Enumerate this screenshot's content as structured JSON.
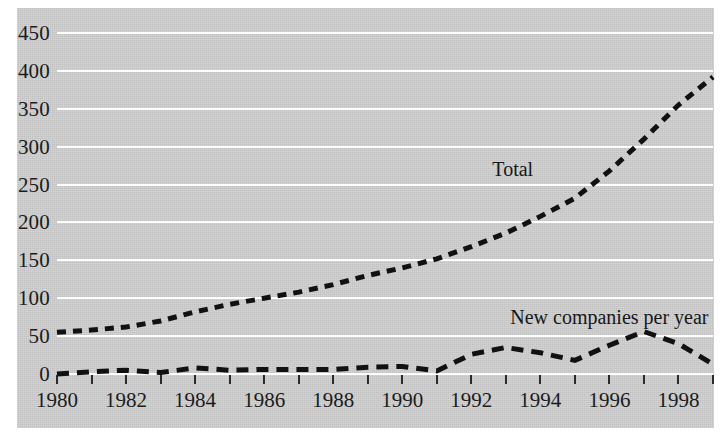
{
  "figure": {
    "background_color": "#ffffff",
    "panel_color": "#d0d0d0",
    "gridline_color": "#ffffff",
    "line_color": "#111111"
  },
  "chart_data": {
    "type": "line",
    "title": "",
    "subtitle": "",
    "xlabel": "",
    "ylabel": "",
    "xlim": [
      1980,
      1999
    ],
    "ylim": [
      0,
      450
    ],
    "ytick_values": [
      0,
      50,
      100,
      150,
      200,
      250,
      300,
      350,
      400,
      450
    ],
    "ytick_labels": [
      "0",
      "50",
      "100",
      "150",
      "200",
      "250",
      "300",
      "350",
      "400",
      "450"
    ],
    "xtick_values": [
      1980,
      1981,
      1982,
      1983,
      1984,
      1985,
      1986,
      1987,
      1988,
      1989,
      1990,
      1991,
      1992,
      1993,
      1994,
      1995,
      1996,
      1997,
      1998,
      1999
    ],
    "xtick_labels_shown": [
      "1980",
      "1982",
      "1984",
      "1986",
      "1988",
      "1990",
      "1992",
      "1994",
      "1996",
      "1998"
    ],
    "xtick_labelled_values": [
      1980,
      1982,
      1984,
      1986,
      1988,
      1990,
      1992,
      1994,
      1996,
      1998
    ],
    "grid": "horizontal",
    "legend_position": "inline-annotations",
    "x": [
      1980,
      1981,
      1982,
      1983,
      1984,
      1985,
      1986,
      1987,
      1988,
      1989,
      1990,
      1991,
      1992,
      1993,
      1994,
      1995,
      1996,
      1997,
      1998,
      1999
    ],
    "series": [
      {
        "name": "Total",
        "label": "Total",
        "style": "dashed",
        "label_x": 1993.2,
        "label_y": 270,
        "values": [
          55,
          58,
          62,
          70,
          82,
          92,
          100,
          108,
          118,
          130,
          140,
          152,
          168,
          186,
          208,
          232,
          268,
          310,
          355,
          392
        ]
      },
      {
        "name": "New companies per year",
        "label": "New companies per year",
        "style": "dashed",
        "label_x": 1996.0,
        "label_y": 75,
        "values": [
          0,
          3,
          5,
          2,
          8,
          5,
          6,
          6,
          6,
          9,
          10,
          4,
          26,
          35,
          28,
          18,
          38,
          56,
          40,
          13
        ]
      }
    ],
    "annotations": [
      {
        "text": "Total",
        "x": 1993.2,
        "y": 270
      },
      {
        "text": "New companies per year",
        "x": 1996.0,
        "y": 75
      }
    ]
  }
}
